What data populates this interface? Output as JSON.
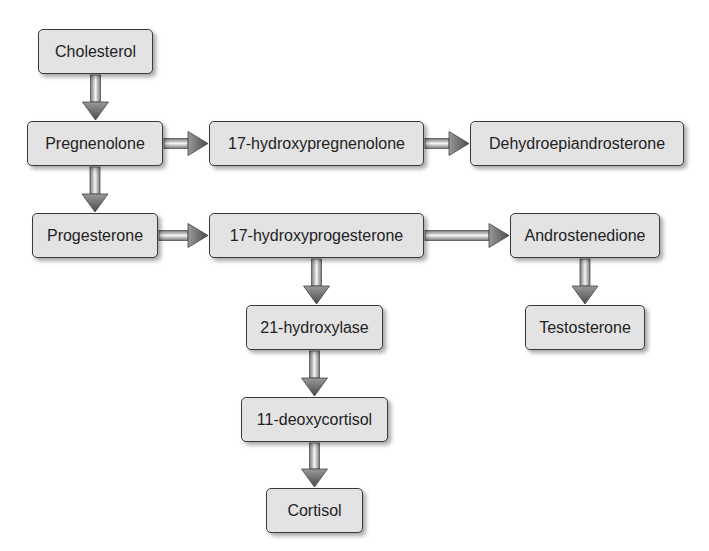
{
  "diagram": {
    "title": "",
    "nodes": [
      {
        "id": "cholesterol",
        "label": "Cholesterol",
        "x": 38,
        "y": 29,
        "w": 115,
        "h": 45
      },
      {
        "id": "pregnenolone",
        "label": "Pregnenolone",
        "x": 27,
        "y": 121,
        "w": 136,
        "h": 45
      },
      {
        "id": "hydroxypregnenolone",
        "label": "17-hydroxypregnenolone",
        "x": 209,
        "y": 121,
        "w": 215,
        "h": 45
      },
      {
        "id": "dhea",
        "label": "Dehydroepiandrosterone",
        "x": 470,
        "y": 121,
        "w": 214,
        "h": 45
      },
      {
        "id": "progesterone",
        "label": "Progesterone",
        "x": 32,
        "y": 213,
        "w": 126,
        "h": 45
      },
      {
        "id": "hydroxyprogesterone",
        "label": "17-hydroxyprogesterone",
        "x": 209,
        "y": 213,
        "w": 215,
        "h": 45
      },
      {
        "id": "androstenedione",
        "label": "Androstenedione",
        "x": 510,
        "y": 213,
        "w": 150,
        "h": 45
      },
      {
        "id": "hydroxylase21",
        "label": "21-hydroxylase",
        "x": 246,
        "y": 305,
        "w": 137,
        "h": 45
      },
      {
        "id": "testosterone",
        "label": "Testosterone",
        "x": 525,
        "y": 305,
        "w": 120,
        "h": 45
      },
      {
        "id": "deoxycortisol",
        "label": "11-deoxycortisol",
        "x": 241,
        "y": 397,
        "w": 147,
        "h": 45
      },
      {
        "id": "cortisol",
        "label": "Cortisol",
        "x": 266,
        "y": 488,
        "w": 97,
        "h": 45
      }
    ],
    "edges": [
      {
        "from": "cholesterol",
        "to": "pregnenolone",
        "dir": "down"
      },
      {
        "from": "pregnenolone",
        "to": "hydroxypregnenolone",
        "dir": "right"
      },
      {
        "from": "hydroxypregnenolone",
        "to": "dhea",
        "dir": "right"
      },
      {
        "from": "pregnenolone",
        "to": "progesterone",
        "dir": "down"
      },
      {
        "from": "progesterone",
        "to": "hydroxyprogesterone",
        "dir": "right"
      },
      {
        "from": "hydroxyprogesterone",
        "to": "androstenedione",
        "dir": "right"
      },
      {
        "from": "hydroxyprogesterone",
        "to": "hydroxylase21",
        "dir": "down"
      },
      {
        "from": "androstenedione",
        "to": "testosterone",
        "dir": "down"
      },
      {
        "from": "hydroxylase21",
        "to": "deoxycortisol",
        "dir": "down"
      },
      {
        "from": "deoxycortisol",
        "to": "cortisol",
        "dir": "down"
      }
    ],
    "colors": {
      "box_fill": "#e3e3e3",
      "box_border": "#3a3a3a",
      "arrow_dark": "#555555",
      "arrow_light": "#f2f2f2"
    }
  }
}
